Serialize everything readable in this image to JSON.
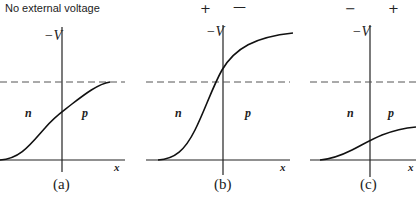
{
  "figure": {
    "title": "No external voltage",
    "axis_label": "−V",
    "x_label": "x",
    "region_n": "n",
    "region_p": "p",
    "panels": [
      {
        "id": "a",
        "label": "(a)",
        "signs": []
      },
      {
        "id": "b",
        "label": "(b)",
        "signs": [
          "+",
          "—"
        ]
      },
      {
        "id": "c",
        "label": "(c)",
        "signs": [
          "−",
          "+"
        ]
      }
    ],
    "colors": {
      "ink": "#222222",
      "dash": "#555555"
    }
  }
}
